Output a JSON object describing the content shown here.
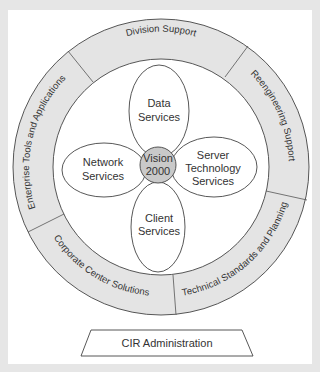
{
  "diagram": {
    "center": {
      "line1": "Vision",
      "line2": "2000"
    },
    "petals": [
      {
        "id": "data",
        "line1": "Data",
        "line2": "Services",
        "line3": ""
      },
      {
        "id": "network",
        "line1": "Network",
        "line2": "Services",
        "line3": ""
      },
      {
        "id": "server",
        "line1": "Server",
        "line2": "Technology",
        "line3": "Services"
      },
      {
        "id": "client",
        "line1": "Client",
        "line2": "Services",
        "line3": ""
      }
    ],
    "ring_segments": [
      {
        "id": "division-support",
        "label": "Division Support"
      },
      {
        "id": "reengineering-support",
        "label": "Reengineering Support"
      },
      {
        "id": "technical-standards",
        "label": "Technical Standards and Planning"
      },
      {
        "id": "corporate-center",
        "label": "Corporate Center Solutions"
      },
      {
        "id": "enterprise-tools",
        "label": "Enterprise Tools and Applications"
      }
    ],
    "base": {
      "label": "CIR Administration"
    }
  },
  "colors": {
    "ring_fill": "#e4e4e4",
    "hub_fill": "#c9c9c9",
    "stroke": "#444444",
    "background": "#e6e6e6",
    "page": "#ffffff"
  }
}
